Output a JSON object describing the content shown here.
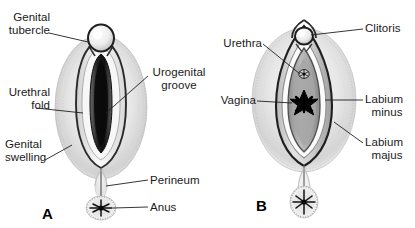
{
  "figure": {
    "background_color": "#ffffff",
    "ink_color": "#1a1a1a",
    "panel_count": 2
  },
  "panels": [
    {
      "id": "A",
      "letter": "A",
      "stage_label": "A",
      "labels": [
        {
          "key": "genital_tubercle",
          "line1": "Genital",
          "line2": "tubercle",
          "side": "left"
        },
        {
          "key": "urethral_fold",
          "line1": "Urethral",
          "line2": "fold",
          "side": "left"
        },
        {
          "key": "genital_swelling",
          "line1": "Genital",
          "line2": "swelling",
          "side": "left"
        },
        {
          "key": "urogenital_groove",
          "line1": "Urogenital",
          "line2": "groove",
          "side": "right"
        },
        {
          "key": "perineum",
          "line1": "Perineum",
          "line2": "",
          "side": "right"
        },
        {
          "key": "anus",
          "line1": "Anus",
          "line2": "",
          "side": "right"
        }
      ]
    },
    {
      "id": "B",
      "letter": "B",
      "stage_label": "B",
      "labels": [
        {
          "key": "clitoris",
          "line1": "Clitoris",
          "line2": "",
          "side": "right"
        },
        {
          "key": "urethra",
          "line1": "Urethra",
          "line2": "",
          "side": "left"
        },
        {
          "key": "vagina",
          "line1": "Vagina",
          "line2": "",
          "side": "left"
        },
        {
          "key": "labium_minus",
          "line1": "Labium",
          "line2": "minus",
          "side": "right"
        },
        {
          "key": "labium_majus",
          "line1": "Labium",
          "line2": "majus",
          "side": "right"
        }
      ]
    }
  ]
}
